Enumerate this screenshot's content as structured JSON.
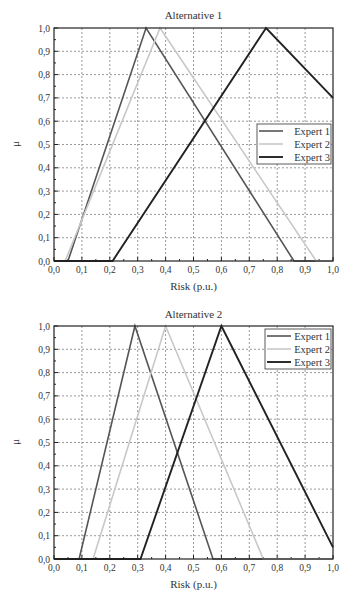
{
  "chart_data": [
    {
      "type": "line",
      "title": "Alternative 1",
      "xlabel": "Risk (p.u.)",
      "ylabel": "μ",
      "xlim": [
        0.0,
        1.0
      ],
      "ylim": [
        0.0,
        1.0
      ],
      "xticks": [
        "0,0",
        "0,1",
        "0,2",
        "0,3",
        "0,4",
        "0,5",
        "0,6",
        "0,7",
        "0,8",
        "0,9",
        "1,0"
      ],
      "yticks": [
        "0,0",
        "0,1",
        "0,2",
        "0,3",
        "0,4",
        "0,5",
        "0,6",
        "0,7",
        "0,8",
        "0,9",
        "1,0"
      ],
      "grid": true,
      "legend_position": "right-middle",
      "series": [
        {
          "name": "Expert 1",
          "color": "#555555",
          "width": 1.6,
          "x": [
            0.0,
            0.05,
            0.33,
            0.86,
            1.0
          ],
          "y": [
            0.0,
            0.0,
            1.0,
            0.0,
            0.0
          ]
        },
        {
          "name": "Expert 2",
          "color": "#c8c8c8",
          "width": 1.6,
          "x": [
            0.0,
            0.04,
            0.38,
            0.94,
            1.0
          ],
          "y": [
            0.0,
            0.0,
            1.0,
            0.0,
            0.0
          ]
        },
        {
          "name": "Expert 3",
          "color": "#222222",
          "width": 1.9,
          "x": [
            0.0,
            0.21,
            0.76,
            1.0
          ],
          "y": [
            0.0,
            0.0,
            1.0,
            0.7
          ]
        }
      ]
    },
    {
      "type": "line",
      "title": "Alternative 2",
      "xlabel": "Risk (p.u.)",
      "ylabel": "μ",
      "xlim": [
        0.0,
        1.0
      ],
      "ylim": [
        0.0,
        1.0
      ],
      "xticks": [
        "0,0",
        "0,1",
        "0,2",
        "0,3",
        "0,4",
        "0,5",
        "0,6",
        "0,7",
        "0,8",
        "0,9",
        "1,0"
      ],
      "yticks": [
        "0,0",
        "0,1",
        "0,2",
        "0,3",
        "0,4",
        "0,5",
        "0,6",
        "0,7",
        "0,8",
        "0,9",
        "1,0"
      ],
      "grid": true,
      "legend_position": "upper-right",
      "series": [
        {
          "name": "Expert 1",
          "color": "#555555",
          "width": 1.6,
          "x": [
            0.0,
            0.09,
            0.29,
            0.57,
            1.0
          ],
          "y": [
            0.0,
            0.0,
            1.0,
            0.0,
            0.0
          ]
        },
        {
          "name": "Expert 2",
          "color": "#c8c8c8",
          "width": 1.6,
          "x": [
            0.0,
            0.14,
            0.4,
            0.75,
            1.0
          ],
          "y": [
            0.0,
            0.0,
            1.0,
            0.0,
            0.0
          ]
        },
        {
          "name": "Expert 3",
          "color": "#222222",
          "width": 1.9,
          "x": [
            0.0,
            0.31,
            0.6,
            1.0
          ],
          "y": [
            0.0,
            0.0,
            1.0,
            0.05
          ]
        }
      ]
    }
  ],
  "layout": [
    {
      "top": 0,
      "plot": {
        "x0": 54,
        "x1": 333,
        "y0": 28,
        "y1": 261
      },
      "title_y": 9,
      "xlabel_y": 280,
      "legend": {
        "x": 257,
        "y": 124,
        "w": 74,
        "h": 40
      }
    },
    {
      "top": 0,
      "plot": {
        "x0": 54,
        "x1": 333,
        "y0": 326,
        "y1": 559
      },
      "title_y": 308,
      "xlabel_y": 578,
      "legend": {
        "x": 265,
        "y": 329,
        "w": 66,
        "h": 40
      }
    }
  ]
}
